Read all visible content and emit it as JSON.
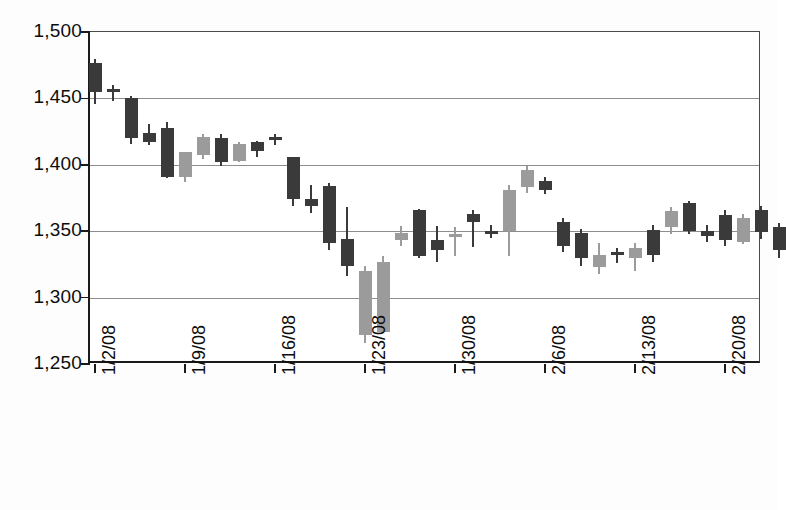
{
  "chart_data": {
    "type": "candlestick",
    "title": "",
    "xlabel": "",
    "ylabel": "",
    "ylim": [
      1250,
      1500
    ],
    "yticks": [
      "1,500",
      "1,450",
      "1,400",
      "1,350",
      "1,300",
      "1,250"
    ],
    "ytick_values": [
      1500,
      1450,
      1400,
      1350,
      1300,
      1250
    ],
    "grid": true,
    "legend": "none",
    "xtick_labels": [
      "1/2/08",
      "1/9/08",
      "1/16/08",
      "1/23/08",
      "1/30/08",
      "2/6/08",
      "2/13/08",
      "2/20/08"
    ],
    "xtick_indices": [
      0,
      5,
      10,
      15,
      20,
      25,
      30,
      35
    ],
    "colors": {
      "up": "#9b9b9b",
      "down": "#3a3a3a",
      "axis": "#1a1a1a",
      "grid": "#8d8d8d"
    },
    "series_name": "Price",
    "candles": [
      {
        "date": "1/2/08",
        "open": 1477,
        "high": 1480,
        "low": 1446,
        "close": 1455,
        "dir": "down"
      },
      {
        "date": "1/3/08",
        "open": 1457,
        "high": 1460,
        "low": 1448,
        "close": 1455,
        "dir": "down"
      },
      {
        "date": "1/4/08",
        "open": 1450,
        "high": 1452,
        "low": 1416,
        "close": 1420,
        "dir": "down"
      },
      {
        "date": "1/7/08",
        "open": 1424,
        "high": 1431,
        "low": 1415,
        "close": 1417,
        "dir": "down"
      },
      {
        "date": "1/8/08",
        "open": 1428,
        "high": 1432,
        "low": 1390,
        "close": 1391,
        "dir": "down"
      },
      {
        "date": "1/9/08",
        "open": 1391,
        "high": 1410,
        "low": 1387,
        "close": 1410,
        "dir": "up"
      },
      {
        "date": "1/10/08",
        "open": 1407,
        "high": 1423,
        "low": 1404,
        "close": 1421,
        "dir": "up"
      },
      {
        "date": "1/11/08",
        "open": 1420,
        "high": 1423,
        "low": 1399,
        "close": 1402,
        "dir": "down"
      },
      {
        "date": "1/14/08",
        "open": 1403,
        "high": 1417,
        "low": 1402,
        "close": 1416,
        "dir": "up"
      },
      {
        "date": "1/15/08",
        "open": 1417,
        "high": 1418,
        "low": 1406,
        "close": 1410,
        "dir": "down"
      },
      {
        "date": "1/16/08",
        "open": 1421,
        "high": 1423,
        "low": 1415,
        "close": 1419,
        "dir": "down"
      },
      {
        "date": "1/17/08",
        "open": 1406,
        "high": 1406,
        "low": 1369,
        "close": 1374,
        "dir": "down"
      },
      {
        "date": "1/18/08",
        "open": 1374,
        "high": 1385,
        "low": 1364,
        "close": 1369,
        "dir": "down"
      },
      {
        "date": "1/22/08",
        "open": 1384,
        "high": 1386,
        "low": 1336,
        "close": 1341,
        "dir": "down"
      },
      {
        "date": "1/23/08",
        "open": 1344,
        "high": 1368,
        "low": 1316,
        "close": 1324,
        "dir": "down"
      },
      {
        "date": "1/24/08",
        "open": 1320,
        "high": 1324,
        "low": 1266,
        "close": 1272,
        "dir": "up"
      },
      {
        "date": "1/25/08",
        "open": 1327,
        "high": 1331,
        "low": 1273,
        "close": 1274,
        "dir": "up"
      },
      {
        "date": "1/28/08",
        "open": 1349,
        "high": 1354,
        "low": 1339,
        "close": 1343,
        "dir": "up"
      },
      {
        "date": "1/29/08",
        "open": 1366,
        "high": 1367,
        "low": 1330,
        "close": 1331,
        "dir": "down"
      },
      {
        "date": "1/30/08",
        "open": 1343,
        "high": 1354,
        "low": 1327,
        "close": 1336,
        "dir": "down"
      },
      {
        "date": "1/31/08",
        "open": 1348,
        "high": 1353,
        "low": 1331,
        "close": 1347,
        "dir": "up"
      },
      {
        "date": "2/1/08",
        "open": 1363,
        "high": 1366,
        "low": 1338,
        "close": 1357,
        "dir": "down"
      },
      {
        "date": "2/4/08",
        "open": 1350,
        "high": 1355,
        "low": 1345,
        "close": 1348,
        "dir": "down"
      },
      {
        "date": "2/5/08",
        "open": 1350,
        "high": 1385,
        "low": 1331,
        "close": 1381,
        "dir": "up"
      },
      {
        "date": "2/6/08",
        "open": 1383,
        "high": 1399,
        "low": 1379,
        "close": 1396,
        "dir": "up"
      },
      {
        "date": "2/7/08",
        "open": 1388,
        "high": 1391,
        "low": 1378,
        "close": 1381,
        "dir": "down"
      },
      {
        "date": "2/8/08",
        "open": 1357,
        "high": 1360,
        "low": 1334,
        "close": 1339,
        "dir": "down"
      },
      {
        "date": "2/11/08",
        "open": 1349,
        "high": 1352,
        "low": 1324,
        "close": 1330,
        "dir": "down"
      },
      {
        "date": "2/12/08",
        "open": 1332,
        "high": 1341,
        "low": 1318,
        "close": 1323,
        "dir": "up"
      },
      {
        "date": "2/13/08",
        "open": 1334,
        "high": 1337,
        "low": 1326,
        "close": 1332,
        "dir": "down"
      },
      {
        "date": "2/14/08",
        "open": 1330,
        "high": 1341,
        "low": 1320,
        "close": 1337,
        "dir": "up"
      },
      {
        "date": "2/15/08",
        "open": 1351,
        "high": 1355,
        "low": 1327,
        "close": 1332,
        "dir": "down"
      },
      {
        "date": "2/19/08",
        "open": 1353,
        "high": 1368,
        "low": 1348,
        "close": 1365,
        "dir": "up"
      },
      {
        "date": "2/20/08",
        "open": 1371,
        "high": 1373,
        "low": 1348,
        "close": 1350,
        "dir": "down"
      },
      {
        "date": "2/21/08",
        "open": 1350,
        "high": 1355,
        "low": 1342,
        "close": 1346,
        "dir": "down"
      },
      {
        "date": "2/22/08",
        "open": 1362,
        "high": 1366,
        "low": 1339,
        "close": 1343,
        "dir": "down"
      },
      {
        "date": "2/25/08",
        "open": 1342,
        "high": 1363,
        "low": 1340,
        "close": 1360,
        "dir": "up"
      },
      {
        "date": "2/26/08",
        "open": 1366,
        "high": 1369,
        "low": 1344,
        "close": 1349,
        "dir": "down"
      },
      {
        "date": "2/27/08",
        "open": 1353,
        "high": 1356,
        "low": 1330,
        "close": 1336,
        "dir": "down"
      }
    ]
  }
}
